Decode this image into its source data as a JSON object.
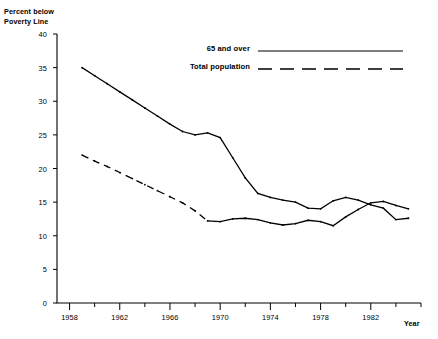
{
  "chart_data": {
    "type": "line",
    "title": "",
    "ylabel": "Percent below\nPoverty Line",
    "xlabel": "Year",
    "xlim": [
      1957,
      1986
    ],
    "ylim": [
      0,
      40
    ],
    "grid": false,
    "legend_position": "top-right",
    "y_ticks": [
      0,
      5,
      10,
      15,
      20,
      25,
      30,
      35,
      40
    ],
    "y_tick_labels": [
      "0",
      "5",
      "10",
      "15",
      "20",
      "25",
      "30",
      "35",
      "40"
    ],
    "x_ticks": [
      1958,
      1960,
      1962,
      1964,
      1966,
      1968,
      1970,
      1972,
      1974,
      1976,
      1978,
      1980,
      1982,
      1984,
      1986
    ],
    "x_tick_labels": [
      "1958",
      "",
      "1962",
      "",
      "1966",
      "",
      "1970",
      "",
      "1974",
      "",
      "1978",
      "",
      "1982",
      "",
      ""
    ],
    "x_major_ticks": [
      1958,
      1962,
      1966,
      1970,
      1974,
      1978,
      1982
    ],
    "series": [
      {
        "name": "65 and over",
        "style": "solid",
        "color": "#000000",
        "x": [
          1959,
          1960,
          1961,
          1962,
          1963,
          1964,
          1965,
          1966,
          1967,
          1968,
          1969,
          1970,
          1971,
          1972,
          1973,
          1974,
          1975,
          1976,
          1977,
          1978,
          1979,
          1980,
          1981,
          1982,
          1983,
          1984,
          1985
        ],
        "values": [
          35.0,
          33.8,
          32.6,
          31.4,
          30.2,
          29.0,
          27.8,
          26.6,
          25.5,
          25.0,
          25.3,
          24.6,
          21.6,
          18.6,
          16.3,
          15.7,
          15.3,
          15.0,
          14.1,
          14.0,
          15.2,
          15.7,
          15.3,
          14.6,
          14.1,
          12.4,
          12.6
        ],
        "annotations": [
          {
            "text": "starts near 35 in 1959, steady decline through the 1960s"
          },
          {
            "text": "small plateau around 25 in 1968-1970"
          },
          {
            "text": "steep drop 1970-1974 to about 16"
          },
          {
            "text": "local low near 14 in 1977-1978"
          },
          {
            "text": "local peak near 15.7 in 1980"
          },
          {
            "text": "crosses the total population line about 1983"
          }
        ]
      },
      {
        "name": "Total population",
        "style": "dashed-then-solid",
        "color": "#000000",
        "solid_from": 1969,
        "x": [
          1959,
          1960,
          1961,
          1962,
          1963,
          1964,
          1965,
          1966,
          1967,
          1968,
          1969,
          1970,
          1971,
          1972,
          1973,
          1974,
          1975,
          1976,
          1977,
          1978,
          1979,
          1980,
          1981,
          1982,
          1983,
          1984,
          1985
        ],
        "values": [
          22.0,
          21.1,
          20.3,
          19.4,
          18.5,
          17.6,
          16.7,
          15.8,
          14.9,
          13.7,
          12.2,
          12.1,
          12.5,
          12.6,
          12.4,
          11.9,
          11.6,
          11.8,
          12.3,
          12.1,
          11.5,
          12.8,
          13.9,
          14.9,
          15.1,
          14.5,
          14.0
        ]
      }
    ]
  },
  "legend": {
    "items": [
      {
        "label": "65 and over",
        "style": "solid"
      },
      {
        "label": "Total population",
        "style": "dashed"
      }
    ]
  },
  "labels": {
    "y_axis_title": "Percent below\nPoverty Line",
    "x_axis_title": "Year"
  }
}
